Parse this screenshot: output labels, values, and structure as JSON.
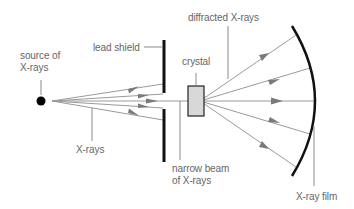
{
  "labels": {
    "source_line1": "source of",
    "source_line2": "X-rays",
    "lead_shield": "lead shield",
    "crystal": "crystal",
    "diffracted": "diffracted X-rays",
    "xrays": "X-rays",
    "narrow_line1": "narrow beam",
    "narrow_line2": "of X-rays",
    "film": "X-ray film"
  },
  "colors": {
    "ray": "#9a9a9a",
    "arrow": "#7a7a7a",
    "shield": "#111111",
    "crystal_fill": "#d8d8d8",
    "crystal_stroke": "#222222",
    "film": "#111111",
    "leader": "#8a8a8a",
    "text": "#666666"
  }
}
